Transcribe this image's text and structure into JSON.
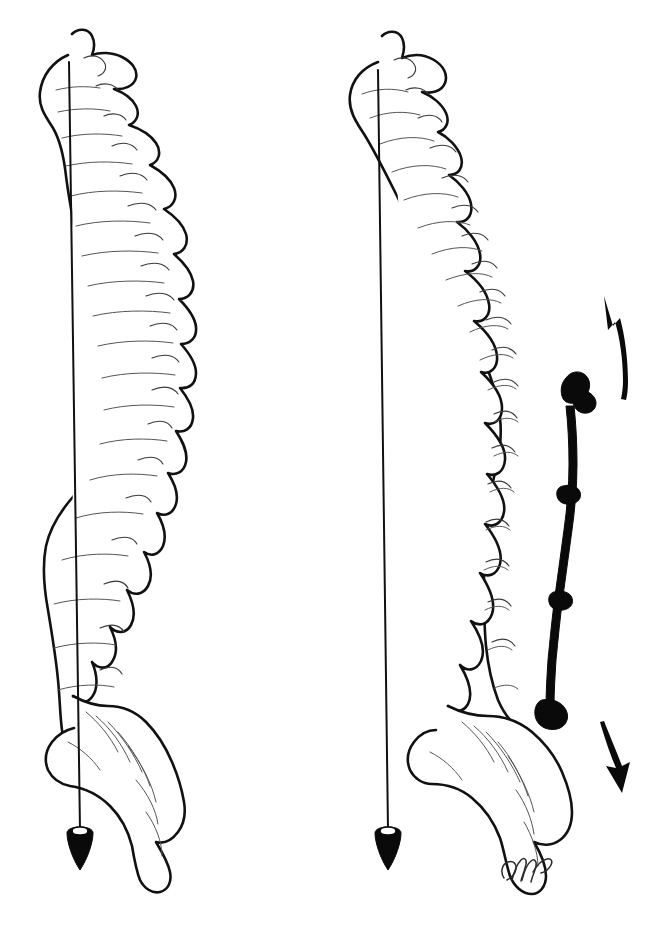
{
  "document": {
    "title": "Sagittal Spinal Balance — Preoperative and Instrumented Comparison",
    "media_type": "line-art medical illustration",
    "background_color": "#ffffff",
    "ink_color": "#111111",
    "detail_ink_color": "#555555",
    "canvas": {
      "width": 661,
      "height": 930
    }
  },
  "panels": [
    {
      "id": "left-panel",
      "name": "Normal sagittal alignment",
      "label": "",
      "plumb_line": {
        "name": "plumb-line-left",
        "origin_x": 69,
        "origin_y": 62,
        "end_x": 80,
        "end_y": 830,
        "description": "C7 plumb line dropping vertically to sacrum"
      },
      "plumb_bob": {
        "name": "plumb-bob-left",
        "x": 80,
        "y": 832,
        "width": 26,
        "height": 38,
        "color": "#0a0a0a"
      },
      "spine": {
        "curvature": "normal thoracic kyphosis with lumbar lordosis",
        "anterior_edge": "left",
        "posterior_edge": "right",
        "top_y": 32,
        "bottom_y": 900
      },
      "instrumentation": null,
      "arrows": []
    },
    {
      "id": "right-panel",
      "name": "Kyphotic deformity with posterior instrumentation",
      "label": "",
      "plumb_line": {
        "name": "plumb-line-right",
        "origin_x": 378,
        "origin_y": 70,
        "end_x": 388,
        "end_y": 830,
        "description": "C7 plumb line falling anterior to sacrum indicating positive sagittal imbalance"
      },
      "plumb_bob": {
        "name": "plumb-bob-right",
        "x": 388,
        "y": 832,
        "width": 26,
        "height": 38,
        "color": "#0a0a0a"
      },
      "spine": {
        "curvature": "increased thoracic kyphosis, flattened lumbar lordosis",
        "anterior_edge": "left",
        "posterior_edge": "right",
        "top_y": 32,
        "bottom_y": 900
      },
      "instrumentation": {
        "name": "posterior-instrumentation-rod",
        "type": "posterior spinal rod with hooks",
        "color": "#0a0a0a",
        "top_y": 378,
        "bottom_y": 730,
        "anchor_points": 4,
        "description": "solid black rod running along the posterior spinous processes from mid thoracic to upper sacral level"
      },
      "arrows": [
        {
          "name": "correction-arrow-upper",
          "direction": "up-left",
          "tip_x": 604,
          "tip_y": 296,
          "tail_x": 627,
          "tail_y": 395,
          "meaning": "upward corrective force vector"
        },
        {
          "name": "correction-arrow-lower",
          "direction": "down-right",
          "tip_x": 622,
          "tip_y": 793,
          "tail_x": 602,
          "tail_y": 722,
          "meaning": "downward corrective force vector"
        }
      ]
    }
  ],
  "signature": {
    "name": "artist-signature",
    "text": "GMc",
    "x": 500,
    "y": 872,
    "style": "cursive monogram"
  },
  "legend": {
    "items": [
      {
        "name": "plumb-line",
        "label": "C7 plumb line"
      },
      {
        "name": "plumb-bob",
        "label": "Plumb bob"
      },
      {
        "name": "instrumentation-rod",
        "label": "Posterior rod"
      },
      {
        "name": "correction-arrow",
        "label": "Correction vector"
      }
    ]
  }
}
